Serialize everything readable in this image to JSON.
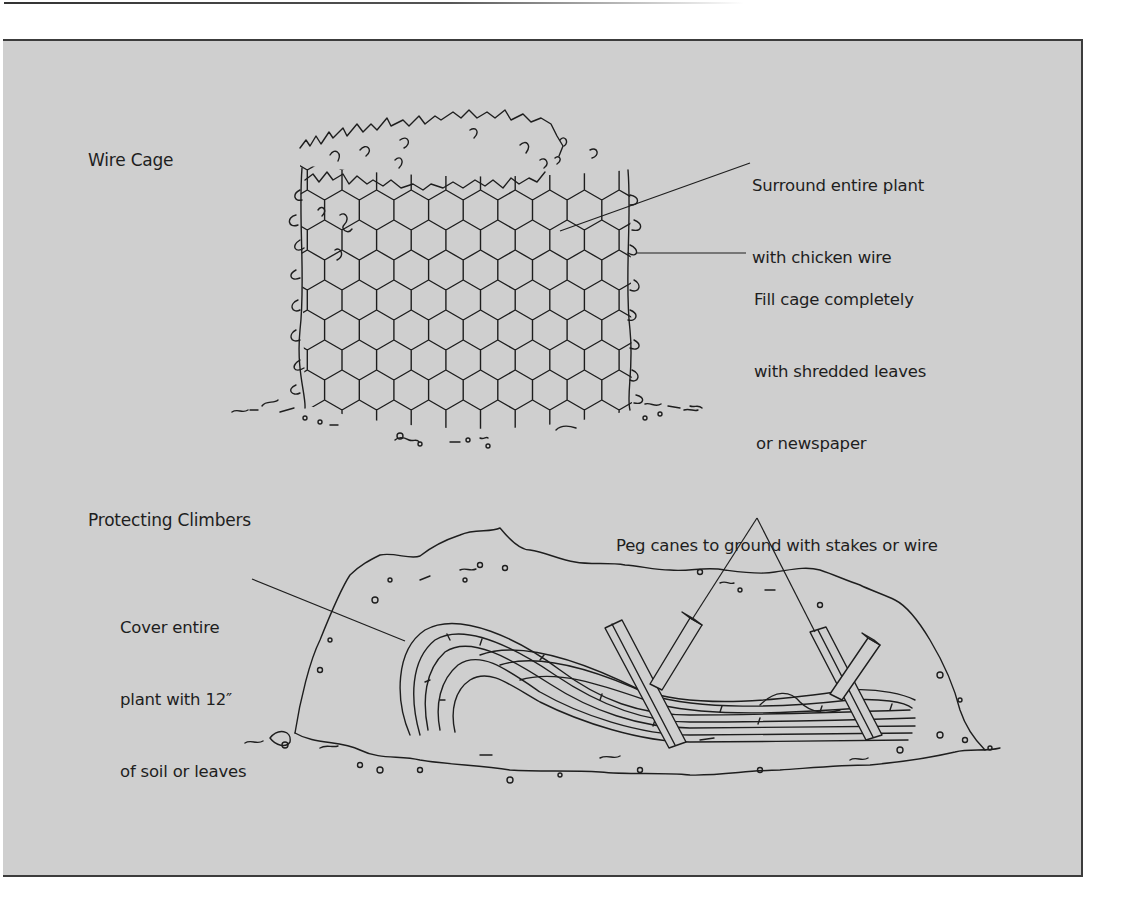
{
  "diagram": {
    "sections": [
      {
        "id": "wire-cage",
        "title": "Wire Cage",
        "callouts": [
          {
            "lines": [
              "Surround entire plant",
              "with chicken wire"
            ]
          },
          {
            "lines": [
              "Fill cage completely",
              "with shredded leaves",
              "or newspaper"
            ]
          }
        ]
      },
      {
        "id": "protecting-climbers",
        "title": "Protecting Climbers",
        "callouts": [
          {
            "lines": [
              "Peg canes to ground with stakes or wire"
            ]
          },
          {
            "lines": [
              "Cover entire",
              "plant with 12″",
              "of soil or leaves"
            ]
          }
        ]
      }
    ],
    "colors": {
      "panel_background": "#cfcfcf",
      "ink": "#1e1e1e"
    }
  }
}
